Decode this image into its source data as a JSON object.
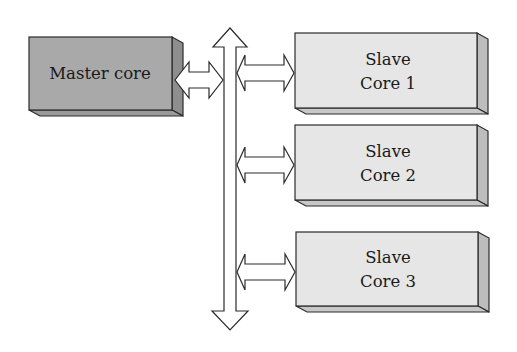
{
  "diagram": {
    "type": "master-slave multicore bus architecture",
    "colors": {
      "master_front": "#a9a9a9",
      "master_side": "#8e8e8e",
      "master_bottom": "#9a9a9a",
      "slave_front": "#e6e6e6",
      "slave_side": "#bdbdbd",
      "slave_bottom": "#c8c8c8",
      "stroke": "#2b2b2b",
      "arrow_fill": "#ffffff"
    },
    "master": {
      "label": "Master core"
    },
    "slaves": [
      {
        "line1": "Slave",
        "line2": "Core 1"
      },
      {
        "line1": "Slave",
        "line2": "Core 2"
      },
      {
        "line1": "Slave",
        "line2": "Core 3"
      }
    ],
    "bus": {
      "direction": "bidirectional vertical"
    },
    "connections": [
      {
        "from": "Master core",
        "to": "bus",
        "type": "bidirectional"
      },
      {
        "from": "bus",
        "to": "Slave Core 1",
        "type": "bidirectional"
      },
      {
        "from": "bus",
        "to": "Slave Core 2",
        "type": "bidirectional"
      },
      {
        "from": "bus",
        "to": "Slave Core 3",
        "type": "bidirectional"
      }
    ]
  }
}
